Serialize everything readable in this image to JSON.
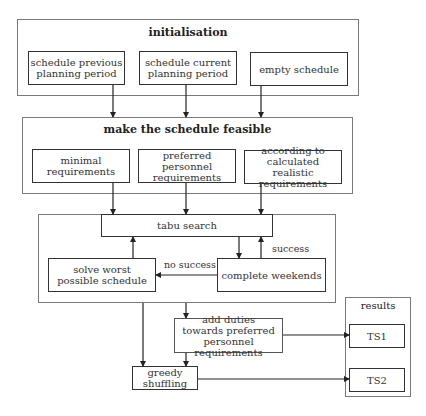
{
  "initialisation": {
    "title": "initialisation",
    "boxes": [
      "schedule previous planning period",
      "schedule current planning period",
      "empty schedule"
    ]
  },
  "feasible": {
    "title": "make the schedule feasible",
    "boxes": [
      "minimal requirements",
      "preferred personnel requirements",
      "according to calculated realistic requirements"
    ]
  },
  "tabu": {
    "search": "tabu search",
    "solve_worst": "solve worst possible schedule",
    "complete_weekends": "complete weekends",
    "success_label": "success",
    "no_success_label": "no success"
  },
  "post": {
    "add_duties": "add duties towards preferred personnel requirements",
    "greedy": "greedy shuffling"
  },
  "results": {
    "title": "results",
    "items": [
      "TS1",
      "TS2"
    ]
  }
}
